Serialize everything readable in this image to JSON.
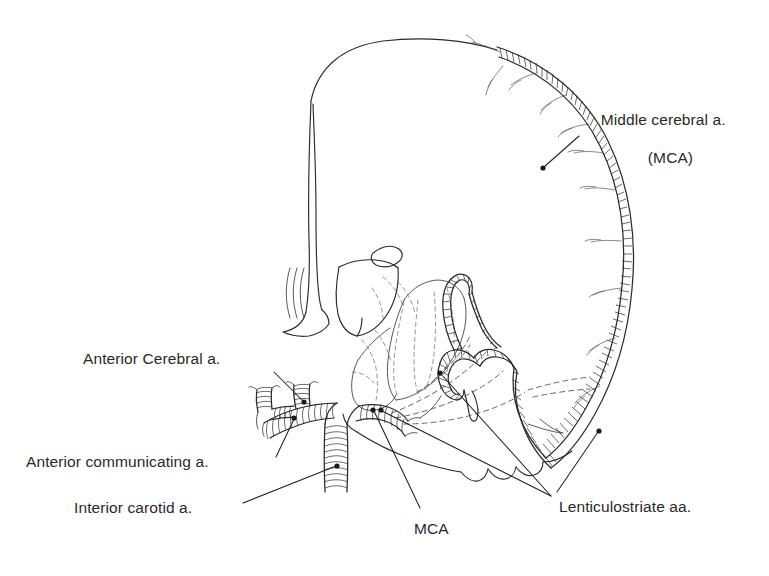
{
  "figure": {
    "kind": "anatomical-line-drawing",
    "background_color": "#ffffff",
    "ink_color": "#2b2b2b",
    "text_color": "#2a2a2a"
  },
  "labels": {
    "middle_cerebral": {
      "line1": "Middle cerebral a.",
      "line2": "(MCA)"
    },
    "anterior_cerebral": "Anterior Cerebral a.",
    "anterior_communicating": "Anterior communicating a.",
    "internal_carotid": "Interior carotid a.",
    "mca_short": "MCA",
    "lenticulostriate": "Lenticulostriate aa."
  },
  "structures": [
    {
      "name": "cerebral-hemisphere-outline",
      "type": "cortex-outline"
    },
    {
      "name": "lateral-ventricle",
      "type": "ventricle-outline"
    },
    {
      "name": "thalamus-basal-ganglia",
      "type": "deep-nucleus-outline"
    },
    {
      "name": "internal-capsule-striatum",
      "type": "dashed-internal-structure"
    },
    {
      "name": "temporal-lobe",
      "type": "lobe-outline"
    },
    {
      "name": "middle-cerebral-artery",
      "type": "hatched-vessel"
    },
    {
      "name": "internal-carotid-artery",
      "type": "hatched-vessel"
    },
    {
      "name": "anterior-cerebral-artery",
      "type": "hatched-vessel"
    },
    {
      "name": "anterior-communicating-artery",
      "type": "hatched-vessel"
    },
    {
      "name": "lenticulostriate-arteries",
      "type": "dashed-vessel-branches"
    },
    {
      "name": "cortical-mca-branches",
      "type": "hatched-vessel-branches"
    }
  ]
}
